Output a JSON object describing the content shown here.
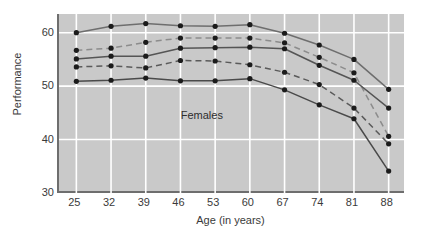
{
  "chart_data": {
    "type": "line",
    "title": "",
    "xlabel": "Age (in years)",
    "ylabel": "Performance",
    "x": [
      25,
      32,
      39,
      46,
      53,
      60,
      67,
      74,
      81,
      88
    ],
    "xtick_labels": [
      "25",
      "32",
      "39",
      "46",
      "53",
      "60",
      "67",
      "74",
      "81",
      "88"
    ],
    "ytick_labels": [
      "60",
      "50",
      "40",
      "30"
    ],
    "yticks": [
      60,
      50,
      40,
      30
    ],
    "ylim": [
      30,
      63.5
    ],
    "xlim": [
      21.5,
      91.5
    ],
    "grid": true,
    "grid_color": "#ffffff",
    "plot_background": "#c9c9c9",
    "legend": "none",
    "annotations": [
      {
        "text": "Females",
        "x": 50.5,
        "y": 44.5
      }
    ],
    "series": [
      {
        "name": "series-1-top-solid",
        "style": "solid",
        "color": "#6e6e6e",
        "marker": "circle",
        "values": [
          60.0,
          61.2,
          61.7,
          61.3,
          61.2,
          61.5,
          59.9,
          57.7,
          55.0,
          49.4
        ]
      },
      {
        "name": "series-2-upper-dashed",
        "style": "dashed",
        "color": "#8c8c8c",
        "marker": "circle",
        "values": [
          56.7,
          57.1,
          58.2,
          59.0,
          59.0,
          59.0,
          58.1,
          55.4,
          52.5,
          40.6
        ]
      },
      {
        "name": "series-3-middle-solid",
        "style": "solid",
        "color": "#555555",
        "marker": "circle",
        "values": [
          55.1,
          55.6,
          55.6,
          57.1,
          57.2,
          57.3,
          57.0,
          53.9,
          51.1,
          45.9
        ]
      },
      {
        "name": "series-4-lower-dashed",
        "style": "dashed",
        "color": "#5a5a5a",
        "marker": "circle",
        "values": [
          53.6,
          53.8,
          53.4,
          54.8,
          54.7,
          54.0,
          52.6,
          50.3,
          45.9,
          39.2
        ]
      },
      {
        "name": "series-5-bottom-solid",
        "style": "solid",
        "color": "#4a4a4a",
        "marker": "circle",
        "values": [
          50.9,
          51.1,
          51.5,
          51.0,
          51.0,
          51.4,
          49.3,
          46.5,
          43.9,
          34.1
        ]
      }
    ]
  }
}
